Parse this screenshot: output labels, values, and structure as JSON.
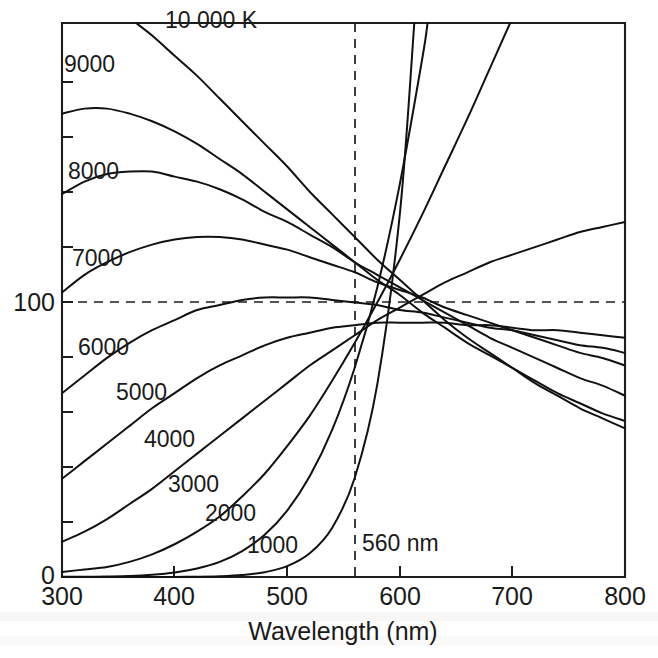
{
  "chart_data": {
    "type": "line",
    "title": "",
    "xlabel": "Wavelength (nm)",
    "ylabel": "",
    "xlim": [
      300,
      800
    ],
    "ylim": [
      0,
      220
    ],
    "xticks": [
      300,
      400,
      500,
      600,
      700,
      800
    ],
    "xtick_labels": [
      "300",
      "400",
      "500",
      "600",
      "700",
      "800"
    ],
    "yticks": [
      0,
      100
    ],
    "ytick_labels": [
      "0",
      "100"
    ],
    "y_minor_ticks": [
      20,
      40,
      60,
      80,
      120,
      140,
      160,
      180,
      200
    ],
    "grid": false,
    "legend": "inline-curve-labels",
    "normalization_wavelength_nm": 560,
    "normalization_value": 100,
    "annotations": [
      {
        "name": "normalization-wavelength",
        "text": "560 nm",
        "x": 560,
        "y": 22
      },
      {
        "name": "unit-label",
        "text": "10 000 K",
        "x": 420,
        "y": 212
      }
    ],
    "series": [
      {
        "name": "10 000 K",
        "label": "10 000 K",
        "temperature_k": 10000,
        "label_x": 420,
        "label_y": 212,
        "x": [
          300,
          320,
          340,
          360,
          380,
          400,
          420,
          440,
          460,
          480,
          500,
          520,
          540,
          560,
          580,
          600,
          620,
          640,
          660,
          680,
          700,
          720,
          740,
          760,
          780,
          800
        ],
        "y": [
          237,
          233,
          228,
          222,
          215,
          207,
          199,
          190,
          181,
          172,
          163,
          153,
          144,
          135,
          126,
          118,
          110,
          102,
          95,
          89,
          83,
          77,
          72,
          67,
          63,
          59
        ]
      },
      {
        "name": "9000 K",
        "label": "9000",
        "temperature_k": 9000,
        "label_x": 333,
        "label_y": 196,
        "x": [
          300,
          320,
          340,
          360,
          380,
          400,
          420,
          440,
          460,
          480,
          500,
          520,
          540,
          560,
          580,
          600,
          620,
          640,
          660,
          680,
          700,
          720,
          740,
          760,
          780,
          800
        ],
        "y": [
          184,
          186,
          186,
          184,
          181,
          177,
          172,
          166,
          160,
          153,
          146,
          139,
          132,
          125,
          118,
          112,
          105,
          99,
          93,
          88,
          83,
          78,
          73,
          69,
          65,
          62
        ]
      },
      {
        "name": "8000 K",
        "label": "8000",
        "temperature_k": 8000,
        "label_x": 338,
        "label_y": 164,
        "x": [
          300,
          320,
          340,
          360,
          380,
          400,
          420,
          440,
          460,
          480,
          500,
          520,
          540,
          560,
          580,
          600,
          620,
          640,
          660,
          680,
          700,
          720,
          740,
          760,
          780,
          800
        ],
        "y": [
          152,
          157,
          160,
          161,
          161,
          159,
          157,
          154,
          150,
          145,
          141,
          136,
          131,
          125,
          120,
          115,
          110,
          105,
          100,
          95,
          91,
          87,
          83,
          79,
          76,
          72
        ]
      },
      {
        "name": "7000 K",
        "label": "7000",
        "temperature_k": 7000,
        "label_x": 340,
        "label_y": 128,
        "x": [
          300,
          320,
          340,
          360,
          380,
          400,
          420,
          440,
          460,
          480,
          500,
          520,
          540,
          560,
          580,
          600,
          620,
          640,
          660,
          680,
          700,
          720,
          740,
          760,
          780,
          800
        ],
        "y": [
          113,
          120,
          125,
          129,
          132,
          134,
          135,
          135,
          134,
          132,
          130,
          127,
          124,
          121,
          117,
          114,
          111,
          107,
          104,
          101,
          98,
          95,
          92,
          89,
          87,
          84
        ]
      },
      {
        "name": "6000 K",
        "label": "6000",
        "temperature_k": 6000,
        "label_x": 340,
        "label_y": 100,
        "x": [
          300,
          320,
          340,
          360,
          380,
          400,
          420,
          440,
          460,
          480,
          500,
          520,
          540,
          560,
          580,
          600,
          620,
          640,
          660,
          680,
          700,
          720,
          740,
          760,
          780,
          800
        ],
        "y": [
          73,
          80,
          87,
          93,
          98,
          102,
          106,
          108,
          110,
          111,
          111,
          111,
          110,
          109,
          108,
          106,
          105,
          103,
          101,
          99,
          98,
          96,
          94,
          92,
          91,
          89
        ]
      },
      {
        "name": "5000 K",
        "label": "5000",
        "temperature_k": 5000,
        "label_x": 375,
        "label_y": 82,
        "x": [
          300,
          320,
          340,
          360,
          380,
          400,
          420,
          440,
          460,
          480,
          500,
          520,
          540,
          560,
          580,
          600,
          620,
          640,
          660,
          680,
          700,
          720,
          740,
          760,
          780,
          800
        ],
        "y": [
          39,
          46,
          53,
          60,
          67,
          73,
          79,
          84,
          88,
          92,
          95,
          97,
          99,
          100,
          101,
          101,
          101,
          101,
          100,
          100,
          99,
          98,
          98,
          97,
          96,
          95
        ]
      },
      {
        "name": "4000 K",
        "label": "4000",
        "temperature_k": 4000,
        "label_x": 398,
        "label_y": 65,
        "x": [
          300,
          320,
          340,
          360,
          380,
          400,
          420,
          440,
          460,
          480,
          500,
          520,
          540,
          560,
          580,
          600,
          620,
          640,
          660,
          680,
          700,
          720,
          740,
          760,
          780,
          800
        ],
        "y": [
          14,
          18,
          23,
          29,
          35,
          42,
          49,
          56,
          63,
          70,
          77,
          84,
          90,
          96,
          102,
          107,
          112,
          117,
          121,
          125,
          128,
          131,
          134,
          137,
          139,
          141
        ]
      },
      {
        "name": "3000 K",
        "label": "3000",
        "temperature_k": 3000,
        "label_x": 420,
        "label_y": 47,
        "x": [
          300,
          320,
          340,
          360,
          380,
          400,
          420,
          440,
          460,
          480,
          500,
          520,
          540,
          560,
          580,
          600,
          620,
          640,
          660,
          680,
          700,
          720,
          740,
          760,
          780,
          800
        ],
        "y": [
          2,
          3,
          4,
          6,
          9,
          13,
          18,
          24,
          32,
          41,
          52,
          64,
          78,
          93,
          109,
          126,
          144,
          163,
          182,
          202,
          222,
          242,
          263,
          284,
          305,
          326
        ]
      },
      {
        "name": "2000 K",
        "label": "2000",
        "temperature_k": 2000,
        "label_x": 455,
        "label_y": 35,
        "x": [
          300,
          320,
          340,
          360,
          380,
          400,
          420,
          440,
          460,
          480,
          500,
          520,
          540,
          560,
          580,
          600,
          620,
          640,
          660,
          680,
          700,
          720,
          740,
          760,
          780,
          800
        ],
        "y": [
          0.05,
          0.1,
          0.2,
          0.4,
          0.9,
          1.8,
          3.4,
          6.0,
          10.3,
          16.8,
          26.4,
          40.0,
          58.5,
          83.2,
          115,
          156,
          206,
          266,
          338,
          423,
          520,
          631,
          756,
          895,
          1048,
          1215
        ]
      },
      {
        "name": "1000 K",
        "label": "1000",
        "temperature_k": 1000,
        "label_x": 497,
        "label_y": 23,
        "x": [
          300,
          320,
          340,
          360,
          380,
          400,
          420,
          440,
          460,
          480,
          500,
          520,
          540,
          560,
          580,
          600,
          620,
          640,
          660,
          680,
          700,
          720,
          740,
          760,
          780,
          800
        ],
        "y": [
          0.0001,
          0.0004,
          0.0014,
          0.005,
          0.015,
          0.045,
          0.12,
          0.32,
          0.8,
          1.9,
          4.3,
          9.4,
          19.6,
          39.4,
          76.5,
          144,
          262,
          464,
          798,
          1337,
          2186,
          3490,
          5450,
          8330,
          12480,
          18340
        ]
      }
    ]
  },
  "axes": {
    "x_title": "Wavelength (nm)",
    "x_tick_labels": [
      "300",
      "400",
      "500",
      "600",
      "700",
      "800"
    ],
    "y_tick_labels": {
      "zero": "0",
      "hundred": "100"
    }
  },
  "curve_labels": {
    "k10000": "10 000 K",
    "k9000": "9000",
    "k8000": "8000",
    "k7000": "7000",
    "k6000": "6000",
    "k5000": "5000",
    "k4000": "4000",
    "k3000": "3000",
    "k2000": "2000",
    "k1000": "1000"
  },
  "guide_label": "560 nm",
  "colors": {
    "ink": "#111111",
    "axis": "#1d1d1d",
    "background": "#ffffff"
  }
}
